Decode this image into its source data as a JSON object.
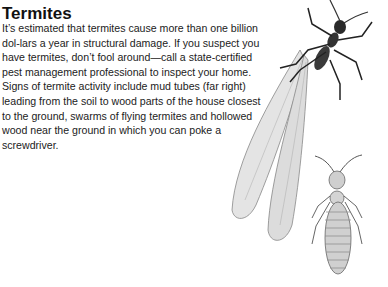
{
  "article": {
    "title": "Termites",
    "paragraphs": [
      "It’s estimated that termites cause more than one billion dol-lars a year in structural damage. If you suspect you have termites, don’t fool around—call a state-certified pest management professional to inspect your home.",
      "Signs of termite activity include mud tubes (far right) leading from the soil to wood parts of the house closest to the ground, swarms of flying termites and hollowed wood near the ground in which you can poke a screwdriver."
    ]
  },
  "illustrations": [
    {
      "name": "winged-termite-illustration",
      "description": "Flying termite with long translucent wings"
    },
    {
      "name": "worker-termite-illustration",
      "description": "Wingless termite with segmented body"
    }
  ]
}
